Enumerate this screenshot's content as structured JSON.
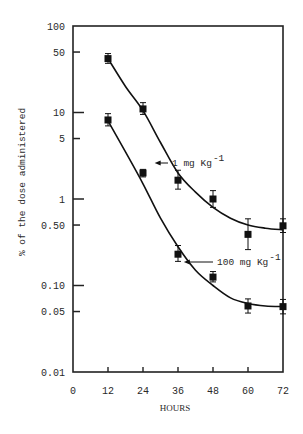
{
  "chart_data": {
    "type": "line",
    "title": "",
    "xlabel": "HOURS",
    "ylabel": "% of the dose administered",
    "yscale": "log",
    "xlim": [
      0,
      72
    ],
    "ylim": [
      0.01,
      100
    ],
    "x_ticks": [
      0,
      12,
      24,
      36,
      48,
      60,
      72
    ],
    "x_tick_labels": [
      "0",
      "12",
      "24",
      "36",
      "48",
      "60",
      "72"
    ],
    "y_ticks": [
      100,
      50,
      10,
      5,
      1,
      0.5,
      0.1,
      0.05,
      0.01
    ],
    "y_tick_labels": [
      "100",
      "50",
      "10",
      "5",
      "1",
      "0.50",
      "0.10",
      "0.05",
      "0.01"
    ],
    "grid": false,
    "legend": "inline annotations with arrows",
    "x": [
      12,
      24,
      36,
      48,
      60,
      72
    ],
    "series": [
      {
        "name": "1 mg Kg-1",
        "label_main": "1 mg Kg",
        "label_sup": "-1",
        "values": [
          42,
          11,
          1.65,
          1.0,
          0.39,
          0.49
        ],
        "err_plus": [
          6,
          2,
          0.5,
          0.25,
          0.2,
          0.1
        ],
        "err_minus": [
          5,
          1.5,
          0.35,
          0.2,
          0.13,
          0.08
        ],
        "fit_curve": [
          [
            12,
            42
          ],
          [
            18,
            20
          ],
          [
            24,
            10.5
          ],
          [
            30,
            4.5
          ],
          [
            36,
            2.0
          ],
          [
            42,
            1.2
          ],
          [
            48,
            0.8
          ],
          [
            54,
            0.6
          ],
          [
            60,
            0.5
          ],
          [
            66,
            0.46
          ],
          [
            72,
            0.44
          ]
        ]
      },
      {
        "name": "100 mg Kg-1",
        "label_main": "100 mg Kg",
        "label_sup": "-1",
        "values": [
          8.2,
          2.0,
          0.23,
          0.125,
          0.058,
          0.057
        ],
        "err_plus": [
          1.5,
          0.2,
          0.06,
          0.02,
          0.012,
          0.012
        ],
        "err_minus": [
          1.2,
          0.2,
          0.04,
          0.015,
          0.01,
          0.01
        ],
        "fit_curve": [
          [
            12,
            8.0
          ],
          [
            18,
            3.5
          ],
          [
            24,
            1.5
          ],
          [
            30,
            0.6
          ],
          [
            36,
            0.28
          ],
          [
            42,
            0.15
          ],
          [
            48,
            0.1
          ],
          [
            54,
            0.072
          ],
          [
            60,
            0.062
          ],
          [
            66,
            0.058
          ],
          [
            72,
            0.057
          ]
        ]
      }
    ],
    "annotations": [
      {
        "text": "1 mg Kg-1",
        "arrow_to": [
          28,
          5.5
        ]
      },
      {
        "text": "100 mg Kg-1",
        "arrow_to": [
          38,
          0.22
        ]
      }
    ]
  }
}
